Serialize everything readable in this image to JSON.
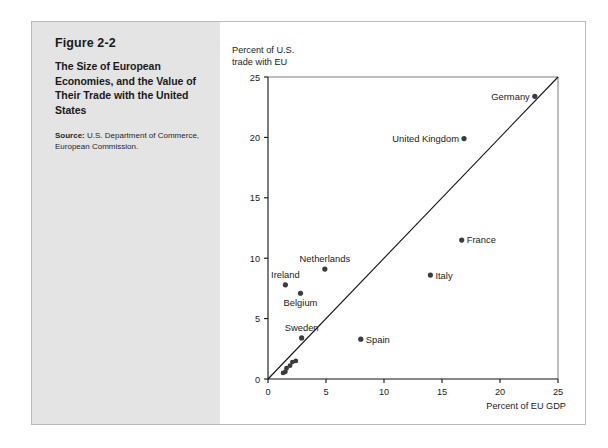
{
  "figure": {
    "number": "Figure 2-2",
    "title": "The Size of European Economies, and the Value of Their Trade with the United States",
    "source_label": "Source:",
    "source_text": " U.S. Department of Commerce, European Commission."
  },
  "chart_data": {
    "type": "scatter",
    "title": "",
    "xlabel": "Percent of EU GDP",
    "ylabel": "Percent of U.S. trade with EU",
    "xlim": [
      0,
      25
    ],
    "ylim": [
      0,
      25
    ],
    "xticks": [
      0,
      5,
      10,
      15,
      20,
      25
    ],
    "yticks": [
      0,
      5,
      10,
      15,
      20,
      25
    ],
    "grid": false,
    "legend": "none",
    "reference_line": {
      "description": "45-degree line",
      "from": [
        0,
        0
      ],
      "to": [
        25,
        25
      ]
    },
    "points": [
      {
        "label": "Germany",
        "x": 23.0,
        "y": 23.4,
        "label_pos": "left"
      },
      {
        "label": "United Kingdom",
        "x": 16.9,
        "y": 19.9,
        "label_pos": "left"
      },
      {
        "label": "France",
        "x": 16.7,
        "y": 11.5,
        "label_pos": "right"
      },
      {
        "label": "Italy",
        "x": 14.0,
        "y": 8.6,
        "label_pos": "right"
      },
      {
        "label": "Netherlands",
        "x": 4.9,
        "y": 9.1,
        "label_pos": "above"
      },
      {
        "label": "Ireland",
        "x": 1.5,
        "y": 7.8,
        "label_pos": "above"
      },
      {
        "label": "Belgium",
        "x": 2.8,
        "y": 7.1,
        "label_pos": "below"
      },
      {
        "label": "Sweden",
        "x": 2.9,
        "y": 3.4,
        "label_pos": "above"
      },
      {
        "label": "Spain",
        "x": 8.0,
        "y": 3.3,
        "label_pos": "right"
      },
      {
        "label": "",
        "x": 2.4,
        "y": 1.5,
        "label_pos": "none"
      },
      {
        "label": "",
        "x": 2.1,
        "y": 1.4,
        "label_pos": "none"
      },
      {
        "label": "",
        "x": 1.9,
        "y": 1.1,
        "label_pos": "none"
      },
      {
        "label": "",
        "x": 1.6,
        "y": 0.9,
        "label_pos": "none"
      },
      {
        "label": "",
        "x": 1.5,
        "y": 0.6,
        "label_pos": "none"
      },
      {
        "label": "",
        "x": 1.3,
        "y": 0.5,
        "label_pos": "none"
      }
    ]
  },
  "axis_text": {
    "y_title_line1": "Percent of U.S.",
    "y_title_line2": "trade with EU",
    "x_title": "Percent of EU GDP"
  }
}
